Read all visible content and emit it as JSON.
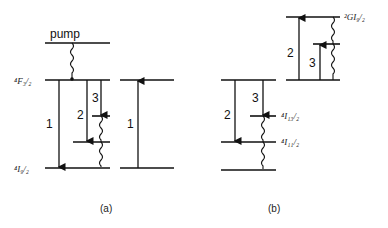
{
  "panel_a": {
    "pump_label": "pump",
    "level_upper": "⁴F₃/₂",
    "level_ground": "⁴I₉/₂",
    "transition_1": "1",
    "transition_2": "2",
    "transition_3": "3",
    "right_transition_1": "1",
    "caption": "(a)"
  },
  "panel_b": {
    "level_top": "²GI₉/₂",
    "level_mid_upper": "⁴I₁₃/₂",
    "level_mid_lower": "⁴I₁₁/₂",
    "transition_2_down": "2",
    "transition_3_down": "3",
    "transition_2_up": "2",
    "transition_3_up": "3",
    "caption": "(b)"
  }
}
